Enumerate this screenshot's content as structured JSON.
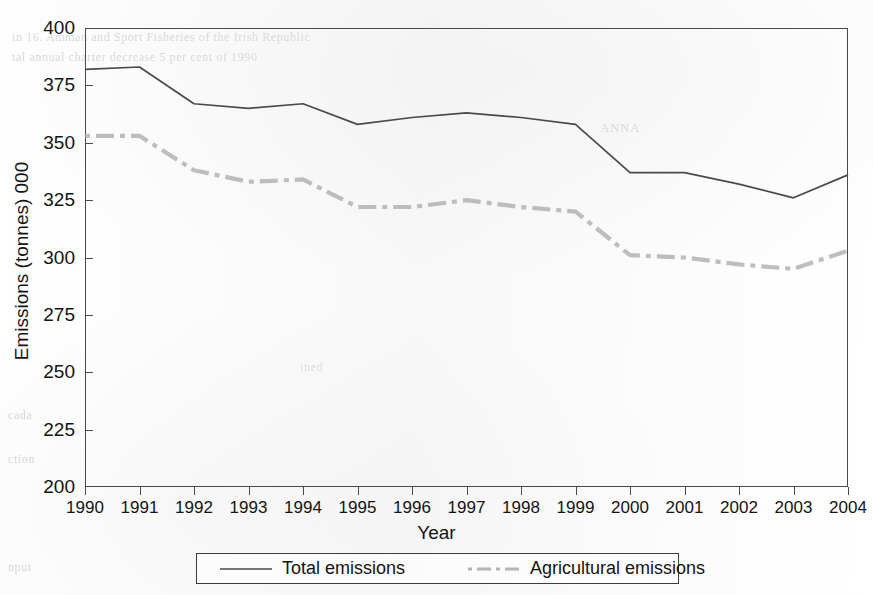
{
  "chart_data": {
    "type": "line",
    "title": "",
    "xlabel": "Year",
    "ylabel": "Emissions (tonnes) 000",
    "x": [
      1990,
      1991,
      1992,
      1993,
      1994,
      1995,
      1996,
      1997,
      1998,
      1999,
      2000,
      2001,
      2002,
      2003,
      2004
    ],
    "categories": [
      "1990",
      "1991",
      "1992",
      "1993",
      "1994",
      "1995",
      "1996",
      "1997",
      "1998",
      "1999",
      "2000",
      "2001",
      "2002",
      "2003",
      "2004"
    ],
    "xlim": [
      1990,
      2004
    ],
    "ylim": [
      200,
      400
    ],
    "yticks": [
      200,
      225,
      250,
      275,
      300,
      325,
      350,
      375,
      400
    ],
    "ytick_labels": [
      "200",
      "225",
      "250",
      "275",
      "300",
      "325",
      "350",
      "375",
      "400"
    ],
    "grid": false,
    "legend_position": "bottom",
    "series": [
      {
        "name": "Total emissions",
        "style": "solid",
        "color": "#4a4a4a",
        "values": [
          382,
          383,
          367,
          365,
          367,
          358,
          361,
          363,
          361,
          358,
          337,
          337,
          332,
          326,
          336
        ]
      },
      {
        "name": "Agricultural emissions",
        "style": "dash-dot",
        "color": "#a8a8a8",
        "values": [
          353,
          353,
          338,
          333,
          334,
          322,
          322,
          325,
          322,
          320,
          301,
          300,
          297,
          295,
          303
        ]
      }
    ]
  },
  "axes": {
    "y_title": "Emissions (tonnes) 000",
    "x_title": "Year"
  },
  "legend": {
    "entries": [
      {
        "label": "Total emissions",
        "style": "solid",
        "color": "#4a4a4a"
      },
      {
        "label": "Agricultural emissions",
        "style": "dash-dot",
        "color": "#a8a8a8"
      }
    ]
  },
  "background_artifacts": {
    "note": "faint photocopy bleed-through of text from reverse page",
    "lines": [
      {
        "text": "in 16. Amman and Sport Fisheries of the Irish Republic",
        "x": 12,
        "y": 30,
        "size": 12
      },
      {
        "text": "tal annual charter decrease 5 per cent of 1990",
        "x": 12,
        "y": 50,
        "size": 12
      },
      {
        "text": "ANNA",
        "x": 600,
        "y": 120,
        "size": 13
      },
      {
        "text": "ined",
        "x": 300,
        "y": 360,
        "size": 12
      },
      {
        "text": "cada",
        "x": 8,
        "y": 408,
        "size": 12
      },
      {
        "text": "ction",
        "x": 8,
        "y": 452,
        "size": 12
      },
      {
        "text": "nput",
        "x": 8,
        "y": 560,
        "size": 12
      }
    ]
  }
}
